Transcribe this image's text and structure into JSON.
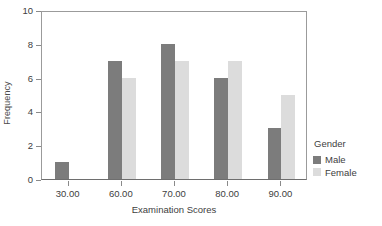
{
  "chart_data": {
    "type": "bar",
    "title": "",
    "subtitle": "",
    "xlabel": "Examination Scores",
    "ylabel": "Frequency",
    "categories": [
      "30.00",
      "60.00",
      "70.00",
      "80.00",
      "90.00"
    ],
    "series": [
      {
        "name": "Male",
        "color": "#7c7c7c",
        "values": [
          1,
          7,
          8,
          6,
          3
        ]
      },
      {
        "name": "Female",
        "color": "#dcdcdc",
        "values": [
          0,
          6,
          7,
          7,
          5
        ]
      }
    ],
    "ylim": [
      0,
      10
    ],
    "ytick_labels": [
      "0",
      "2",
      "4",
      "6",
      "8",
      "10"
    ],
    "ytick_values": [
      0,
      2,
      4,
      6,
      8,
      10
    ],
    "grid": false,
    "legend": {
      "title": "Gender",
      "position": "right",
      "entries": [
        {
          "label": "Male",
          "color": "#7c7c7c"
        },
        {
          "label": "Female",
          "color": "#dcdcdc"
        }
      ]
    }
  },
  "colors": {
    "male": "#7c7c7c",
    "female": "#dcdcdc",
    "axis": "#6e6e6e",
    "frame": "#9b9b9b",
    "text": "#404040",
    "background": "#ffffff"
  }
}
